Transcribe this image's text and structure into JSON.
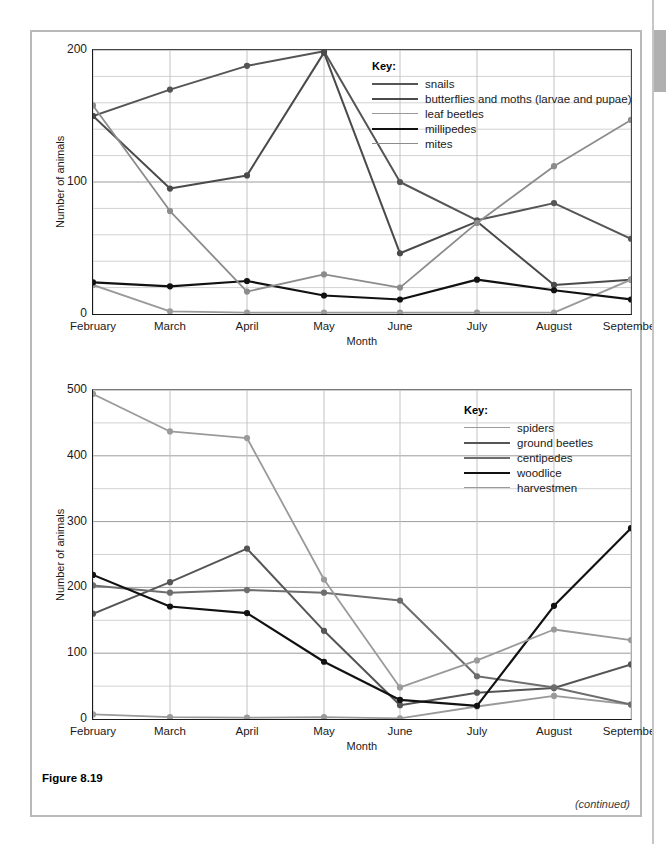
{
  "page": {
    "figure_caption": "Figure 8.19",
    "continued_note": "(continued)"
  },
  "chart_data": [
    {
      "type": "line",
      "id": "chart-top",
      "title": "",
      "xlabel": "Month",
      "ylabel": "Number of animals",
      "categories": [
        "February",
        "March",
        "April",
        "May",
        "June",
        "July",
        "August",
        "September"
      ],
      "ylim": [
        0,
        200
      ],
      "yticks": [
        0,
        100,
        200
      ],
      "ytick_labels": [
        "0",
        "100",
        "200"
      ],
      "minor_y_step": 20,
      "grid": true,
      "legend_title": "Key:",
      "legend_position": "inside-top-right",
      "series": [
        {
          "name": "snails",
          "color": "#555555",
          "width": 2.0,
          "values": [
            150,
            170,
            188,
            199,
            100,
            71,
            84,
            57
          ]
        },
        {
          "name": "butterflies and moths (larvae and pupae)",
          "color": "#4a4a4a",
          "width": 2.0,
          "values": [
            150,
            95,
            105,
            198,
            46,
            70,
            22,
            26
          ]
        },
        {
          "name": "leaf beetles",
          "color": "#9a9a9a",
          "width": 1.8,
          "values": [
            22,
            2,
            1,
            1,
            1,
            1,
            1,
            26
          ]
        },
        {
          "name": "millipedes",
          "color": "#111111",
          "width": 2.2,
          "values": [
            24,
            21,
            25,
            14,
            11,
            26,
            18,
            11
          ]
        },
        {
          "name": "mites",
          "color": "#8c8c8c",
          "width": 1.8,
          "values": [
            158,
            78,
            17,
            30,
            20,
            69,
            112,
            147
          ]
        }
      ]
    },
    {
      "type": "line",
      "id": "chart-bottom",
      "title": "",
      "xlabel": "Month",
      "ylabel": "Number of animals",
      "categories": [
        "February",
        "March",
        "April",
        "May",
        "June",
        "July",
        "August",
        "September"
      ],
      "ylim": [
        0,
        500
      ],
      "yticks": [
        0,
        100,
        200,
        300,
        400,
        500
      ],
      "ytick_labels": [
        "0",
        "100",
        "200",
        "300",
        "400",
        "500"
      ],
      "minor_y_step": 50,
      "grid": true,
      "legend_title": "Key:",
      "legend_position": "inside-top-right",
      "series": [
        {
          "name": "spiders",
          "color": "#9a9a9a",
          "width": 1.8,
          "values": [
            7,
            3,
            2,
            3,
            1,
            19,
            35,
            22
          ]
        },
        {
          "name": "ground beetles",
          "color": "#555555",
          "width": 2.0,
          "values": [
            160,
            208,
            259,
            134,
            21,
            40,
            47,
            83
          ]
        },
        {
          "name": "centipedes",
          "color": "#6d6d6d",
          "width": 2.0,
          "values": [
            203,
            192,
            196,
            192,
            180,
            65,
            48,
            22
          ]
        },
        {
          "name": "woodlice",
          "color": "#111111",
          "width": 2.2,
          "values": [
            219,
            171,
            161,
            87,
            29,
            20,
            172,
            290
          ]
        },
        {
          "name": "harvestmen",
          "color": "#9a9a9a",
          "width": 1.8,
          "values": [
            494,
            437,
            427,
            212,
            48,
            89,
            136,
            120
          ]
        }
      ]
    }
  ]
}
